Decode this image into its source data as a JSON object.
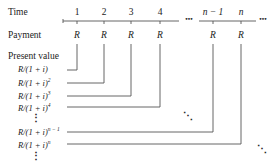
{
  "row_labels": {
    "time": "Time",
    "payment": "Payment",
    "present_value": "Present value"
  },
  "time_ticks": [
    {
      "label": "1",
      "x": 77
    },
    {
      "label": "2",
      "x": 104
    },
    {
      "label": "3",
      "x": 131
    },
    {
      "label": "4",
      "x": 160
    },
    {
      "label": "n − 1",
      "x": 213
    },
    {
      "label": "n",
      "x": 241
    }
  ],
  "ellipsis": "•••",
  "payment_symbol": "R",
  "present_values": [
    {
      "base": "R/(1 + i)",
      "exp": ""
    },
    {
      "base": "R/(1 + i)",
      "exp": "2"
    },
    {
      "base": "R/(1 + i)",
      "exp": "3"
    },
    {
      "base": "R/(1 + i)",
      "exp": "4"
    },
    {
      "base": "R/(1 + i)",
      "exp": "n − 1"
    },
    {
      "base": "R/(1 + i)",
      "exp": "n"
    }
  ],
  "vertical_ellipsis": "⋮",
  "diagonal_ellipsis": "⋱"
}
